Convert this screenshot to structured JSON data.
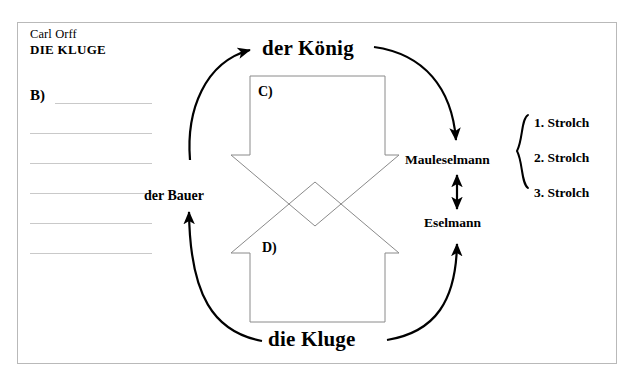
{
  "document": {
    "composer": "Carl Orff",
    "work_title": "DIE KLUGE"
  },
  "answer_section": {
    "label": "B)",
    "line_count": 6
  },
  "diagram": {
    "type": "relationship-cycle",
    "nodes": [
      {
        "id": "koenig",
        "label": "der König",
        "role": "top"
      },
      {
        "id": "kluge",
        "label": "die Kluge",
        "role": "bottom"
      },
      {
        "id": "bauer",
        "label": "der Bauer",
        "role": "left"
      },
      {
        "id": "mauleselmann",
        "label": "Mauleselmann",
        "role": "right-upper"
      },
      {
        "id": "eselmann",
        "label": "Eselmann",
        "role": "right-lower"
      }
    ],
    "inner_letters": [
      {
        "id": "c",
        "label": "C)",
        "shape": "down-arrow"
      },
      {
        "id": "d",
        "label": "D)",
        "shape": "up-arrow"
      }
    ],
    "strolch_group": {
      "brace": "curly-brace-left",
      "items": [
        "1. Strolch",
        "2. Strolch",
        "3. Strolch"
      ]
    },
    "connections": [
      {
        "from": "bauer",
        "to": "koenig",
        "style": "curved-arrow",
        "direction": "one-way"
      },
      {
        "from": "koenig",
        "to": "mauleselmann",
        "style": "curved-arrow",
        "direction": "one-way"
      },
      {
        "from": "kluge",
        "to": "eselmann",
        "style": "curved-arrow",
        "direction": "one-way"
      },
      {
        "from": "kluge",
        "to": "bauer",
        "style": "curved-arrow",
        "direction": "one-way"
      },
      {
        "from": "mauleselmann",
        "to": "eselmann",
        "style": "straight-arrow",
        "direction": "two-way"
      }
    ],
    "colors": {
      "stroke": "#000000",
      "shape_outline": "#808080",
      "frame": "#b9b9b9",
      "rule_line": "#c9c9c9",
      "background": "#ffffff"
    }
  }
}
